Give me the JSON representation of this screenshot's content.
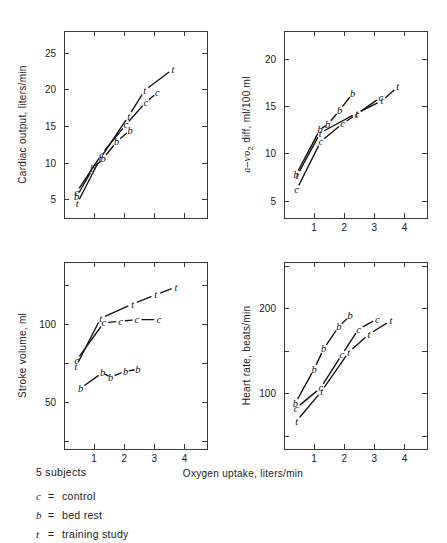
{
  "figure": {
    "shared_xlabel": "Oxygen uptake, liters/min",
    "subjects_note": "5 subjects",
    "legend": [
      {
        "symbol": "c",
        "equals": "=",
        "label": "control"
      },
      {
        "symbol": "b",
        "equals": "=",
        "label": "bed rest"
      },
      {
        "symbol": "t",
        "equals": "=",
        "label": "training study"
      }
    ],
    "marker_meanings": {
      "c": "control",
      "b": "bed rest",
      "t": "training study"
    },
    "ink_color": "#111111",
    "axis_color": "#3a3a3a"
  },
  "chart_data": [
    {
      "type": "line",
      "panel": "top-left",
      "title": "",
      "ylabel": "Cardiac output, liters/min",
      "xlabel": "Oxygen uptake, liters/min",
      "xlim": [
        0,
        4.75
      ],
      "ylim": [
        2.5,
        28
      ],
      "xticks": [
        1,
        2,
        3,
        4
      ],
      "xticklabels": [
        "1",
        "2",
        "3",
        "4"
      ],
      "xticks_visible_labels": false,
      "yticks": [
        5,
        10,
        15,
        20,
        25
      ],
      "yticklabels": [
        "5",
        "10",
        "15",
        "20",
        "25"
      ],
      "grid": false,
      "legend_position": "none",
      "series": [
        {
          "name": "control",
          "marker": "c",
          "x": [
            0.42,
            1.25,
            2.05,
            2.72,
            3.1
          ],
          "y": [
            6.0,
            11.2,
            15.2,
            18.3,
            19.6
          ]
        },
        {
          "name": "bed rest",
          "marker": "b",
          "x": [
            0.42,
            0.95,
            1.3,
            1.75,
            2.2
          ],
          "y": [
            5.4,
            9.2,
            10.6,
            12.9,
            14.5
          ]
        },
        {
          "name": "training study",
          "marker": "t",
          "x": [
            0.44,
            1.2,
            2.15,
            2.68,
            3.62
          ],
          "y": [
            4.5,
            10.6,
            16.4,
            19.9,
            22.8
          ]
        }
      ]
    },
    {
      "type": "line",
      "panel": "top-right",
      "title": "",
      "ylabel": "a-ѵo₂ diff, ml/100 ml",
      "xlabel": "Oxygen uptake, liters/min",
      "xlim": [
        0,
        4.75
      ],
      "ylim": [
        3.2,
        23
      ],
      "xticks": [
        1,
        2,
        3,
        4
      ],
      "xticklabels": [
        "1",
        "2",
        "3",
        "4"
      ],
      "xticks_visible_labels": true,
      "yticks": [
        5,
        10,
        15,
        20
      ],
      "yticklabels": [
        "5",
        "10",
        "15",
        "20"
      ],
      "grid": false,
      "legend_position": "none",
      "series": [
        {
          "name": "control",
          "marker": "c",
          "x": [
            0.42,
            1.22,
            1.95,
            2.42,
            3.22
          ],
          "y": [
            6.2,
            11.3,
            13.2,
            14.2,
            16.0
          ]
        },
        {
          "name": "bed rest",
          "marker": "b",
          "x": [
            0.4,
            1.2,
            1.45,
            1.85,
            2.28
          ],
          "y": [
            7.8,
            12.6,
            13.1,
            14.6,
            16.4
          ]
        },
        {
          "name": "training study",
          "marker": "t",
          "x": [
            0.44,
            1.2,
            2.42,
            3.25,
            3.78
          ],
          "y": [
            7.7,
            12.2,
            14.3,
            15.6,
            17.1
          ]
        }
      ]
    },
    {
      "type": "line",
      "panel": "bottom-left",
      "title": "",
      "ylabel": "Stroke volume, ml",
      "xlabel": "Oxygen uptake, liters/min",
      "xlim": [
        0,
        4.75
      ],
      "ylim": [
        20,
        140
      ],
      "xticks": [
        1,
        2,
        3,
        4
      ],
      "xticklabels": [
        "1",
        "2",
        "3",
        "4"
      ],
      "xticks_visible_labels": true,
      "yticks": [
        50,
        100
      ],
      "yticklabels": [
        "50",
        "100"
      ],
      "grid": false,
      "legend_position": "none",
      "series": [
        {
          "name": "control",
          "marker": "c",
          "x": [
            0.42,
            1.32,
            1.88,
            2.42,
            3.15
          ],
          "y": [
            77,
            101,
            102,
            103,
            103
          ]
        },
        {
          "name": "bed rest",
          "marker": "b",
          "x": [
            0.55,
            1.28,
            1.55,
            2.05,
            2.45
          ],
          "y": [
            59,
            69,
            66,
            70,
            71
          ]
        },
        {
          "name": "training study",
          "marker": "t",
          "x": [
            0.4,
            1.22,
            2.28,
            3.05,
            3.72
          ],
          "y": [
            73,
            104,
            113,
            119,
            124
          ]
        }
      ]
    },
    {
      "type": "line",
      "panel": "bottom-right",
      "title": "",
      "ylabel": "Heart rate, beats/min",
      "xlabel": "Oxygen uptake, liters/min",
      "xlim": [
        0,
        4.75
      ],
      "ylim": [
        35,
        255
      ],
      "xticks": [
        1,
        2,
        3,
        4
      ],
      "xticklabels": [
        "1",
        "2",
        "3",
        "4"
      ],
      "xticks_visible_labels": true,
      "yticks": [
        100,
        200
      ],
      "yticklabels": [
        "100",
        "200"
      ],
      "grid": false,
      "legend_position": "none",
      "series": [
        {
          "name": "control",
          "marker": "c",
          "x": [
            0.4,
            1.22,
            1.92,
            2.48,
            3.1
          ],
          "y": [
            83,
            107,
            146,
            176,
            188
          ]
        },
        {
          "name": "bed rest",
          "marker": "b",
          "x": [
            0.38,
            1.0,
            1.32,
            1.82,
            2.2
          ],
          "y": [
            89,
            129,
            153,
            179,
            192
          ]
        },
        {
          "name": "training study",
          "marker": "t",
          "x": [
            0.42,
            1.25,
            2.15,
            2.82,
            3.55
          ],
          "y": [
            68,
            103,
            149,
            170,
            186
          ]
        }
      ]
    }
  ]
}
